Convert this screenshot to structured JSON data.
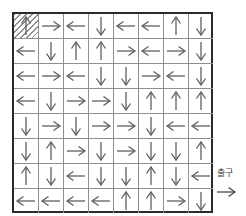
{
  "page": {
    "background": "#ffffff"
  },
  "board": {
    "rows": 8,
    "cols": 8,
    "border_color": "#2b2b2b",
    "grid_line_color": "#8f8f8f",
    "arrow_color": "#5f5f5f",
    "start_cell": {
      "row": 0,
      "col": 0,
      "style": "hatched"
    },
    "cells": [
      [
        "up",
        "right",
        "left",
        "down",
        "left",
        "left",
        "up",
        "down"
      ],
      [
        "left",
        "down",
        "up",
        "up",
        "right",
        "left",
        "right",
        "down"
      ],
      [
        "left",
        "right",
        "left",
        "down",
        "down",
        "right",
        "left",
        "down"
      ],
      [
        "left",
        "down",
        "right",
        "right",
        "down",
        "up",
        "up",
        "up"
      ],
      [
        "down",
        "right",
        "down",
        "right",
        "right",
        "down",
        "left",
        "left"
      ],
      [
        "down",
        "up",
        "right",
        "down",
        "right",
        "down",
        "down",
        "up"
      ],
      [
        "up",
        "down",
        "left",
        "down",
        "down",
        "up",
        "down",
        "left"
      ],
      [
        "left",
        "left",
        "left",
        "left",
        "up",
        "up",
        "right",
        "down"
      ]
    ]
  },
  "exit": {
    "label": "출구",
    "arrow_direction": "right"
  }
}
